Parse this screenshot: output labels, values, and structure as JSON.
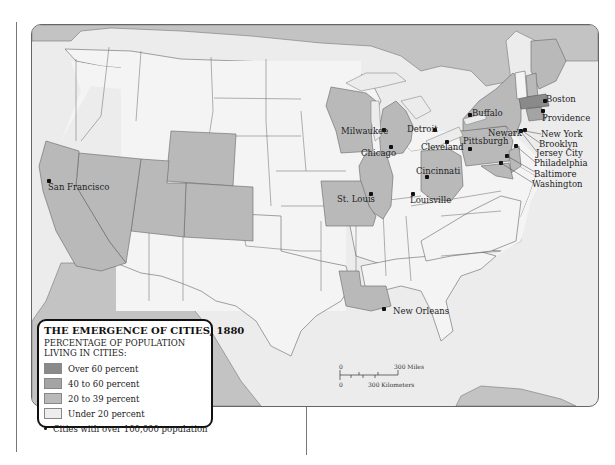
{
  "legend": {
    "title": "THE EMERGENCE OF CITIES, 1880",
    "subtitle_line1": "PERCENTAGE OF POPULATION",
    "subtitle_line2": "LIVING IN CITIES:",
    "items": [
      {
        "label": "Over 60 percent",
        "color": "#8a8a8a"
      },
      {
        "label": "40 to 60 percent",
        "color": "#a4a4a4"
      },
      {
        "label": "20 to 39 percent",
        "color": "#b9b9b9"
      },
      {
        "label": "Under 20 percent",
        "color": "#ededed"
      }
    ],
    "city_marker_label": "Cities with over 100,000 population"
  },
  "scale_bar": {
    "zero_top": "0",
    "miles_label": "300 Miles",
    "zero_bottom": "0",
    "km_label": "300 Kilometers"
  },
  "cities": [
    {
      "name": "San Francisco"
    },
    {
      "name": "Milwaukee"
    },
    {
      "name": "Chicago"
    },
    {
      "name": "Detroit"
    },
    {
      "name": "Cleveland"
    },
    {
      "name": "Buffalo"
    },
    {
      "name": "Pittsburgh"
    },
    {
      "name": "Cincinnati"
    },
    {
      "name": "Louisville"
    },
    {
      "name": "St. Louis"
    },
    {
      "name": "New Orleans"
    },
    {
      "name": "Boston"
    },
    {
      "name": "Providence"
    },
    {
      "name": "Newark"
    },
    {
      "name": "New York"
    },
    {
      "name": "Brooklyn"
    },
    {
      "name": "Jersey City"
    },
    {
      "name": "Philadelphia"
    },
    {
      "name": "Baltimore"
    },
    {
      "name": "Washington"
    }
  ],
  "colors": {
    "over60": "#8a8a8a",
    "c40to60": "#a4a4a4",
    "c20to39": "#b9b9b9",
    "under20": "#f4f4f4",
    "foreign": "#c3c3c3",
    "water": "#ececec"
  }
}
